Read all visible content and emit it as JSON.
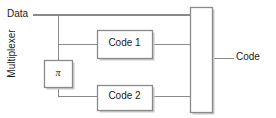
{
  "diagram": {
    "colors": {
      "wire": "#8a8a8a",
      "box_border": "#8a8a8a",
      "box_fill": "#ffffff",
      "shadow": "#c9c9c9",
      "text": "#1a1a1a",
      "background": "#ffffff"
    },
    "inputs": [
      {
        "id": "data",
        "label": "Data"
      }
    ],
    "outputs": [
      {
        "id": "code",
        "label": "Code"
      }
    ],
    "blocks": [
      {
        "id": "code1",
        "label": "Code 1",
        "x": 97,
        "y": 30,
        "w": 55,
        "h": 28
      },
      {
        "id": "code2",
        "label": "Code 2",
        "x": 97,
        "y": 85,
        "w": 55,
        "h": 25
      },
      {
        "id": "interleaver",
        "label": "π",
        "x": 44,
        "y": 60,
        "w": 28,
        "h": 28
      },
      {
        "id": "multiplexer",
        "label": "Multiplexer",
        "x": 190,
        "y": 7,
        "w": 22,
        "h": 106,
        "orientation": "vertical"
      }
    ],
    "connections": [
      {
        "from": "data",
        "to": "multiplexer",
        "note": "systematic branch, top line"
      },
      {
        "from": "data",
        "to": "code1",
        "note": "tap at x=58 to Code 1 input"
      },
      {
        "from": "data",
        "to": "interleaver",
        "note": "tap at x=58 down into pi"
      },
      {
        "from": "interleaver",
        "to": "code2",
        "note": "pi output to Code 2 input"
      },
      {
        "from": "code1",
        "to": "multiplexer",
        "note": "Code 1 parity to mux"
      },
      {
        "from": "code2",
        "to": "multiplexer",
        "note": "Code 2 parity to mux"
      },
      {
        "from": "multiplexer",
        "to": "code",
        "note": "multiplexed output"
      }
    ]
  }
}
